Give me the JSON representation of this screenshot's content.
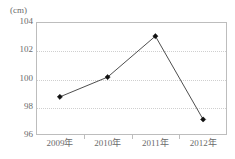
{
  "chart_data": {
    "type": "line",
    "title": "",
    "subtitle": "",
    "xlabel": "",
    "ylabel": "",
    "unit_label": "(cm)",
    "categories": [
      "2009年",
      "2010年",
      "2011年",
      "2012年"
    ],
    "values": [
      98.7,
      100.1,
      103.0,
      97.1
    ],
    "series": [
      {
        "name": "",
        "values": [
          98.7,
          100.1,
          103.0,
          97.1
        ]
      }
    ],
    "ylim": [
      96,
      104
    ],
    "yticks": [
      104,
      102,
      100,
      98,
      96
    ],
    "ytick_labels": [
      "104",
      "102",
      "100",
      "98",
      "96"
    ],
    "grid": true,
    "grid_axis": "y",
    "grid_style": "dotted",
    "legend": false,
    "legend_position": "none",
    "marker": "diamond",
    "colors": {
      "line": "#3a3a3a",
      "marker": "#111111",
      "grid": "#cfcfcf",
      "frame": "#bdbdbd",
      "text": "#6a6a6a",
      "background": "#ffffff"
    }
  }
}
